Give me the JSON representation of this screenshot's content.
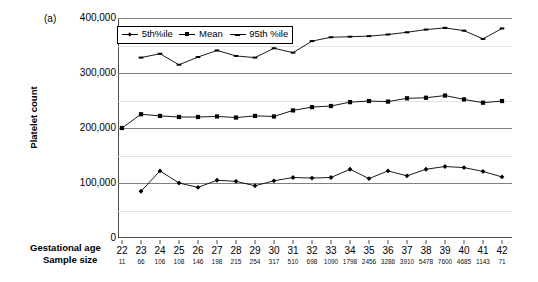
{
  "figure": {
    "panel_label": "(a)",
    "row_title_age": "Gestational age",
    "row_title_sample": "Sample size"
  },
  "chart_data": {
    "type": "line",
    "title": "",
    "xlabel": "Gestational age",
    "ylabel": "Platelet count",
    "ylim": [
      0,
      400000
    ],
    "yticks": [
      0,
      100000,
      200000,
      300000,
      400000
    ],
    "ytick_labels": [
      "0",
      "100,000",
      "200,000",
      "300,000",
      "400,000"
    ],
    "grid": true,
    "legend_position": "top-left-inside",
    "categories": [
      22,
      23,
      24,
      25,
      26,
      27,
      28,
      29,
      30,
      31,
      32,
      33,
      34,
      35,
      36,
      37,
      38,
      39,
      40,
      41,
      42
    ],
    "x_tick_labels": [
      "22",
      "23",
      "24",
      "25",
      "26",
      "27",
      "28",
      "29",
      "30",
      "31",
      "32",
      "33",
      "34",
      "35",
      "36",
      "37",
      "38",
      "39",
      "40",
      "41",
      "42"
    ],
    "sample_size_label": "Sample size",
    "sample_sizes": [
      11,
      66,
      106,
      108,
      146,
      198,
      215,
      254,
      317,
      510,
      698,
      1090,
      1798,
      2456,
      3286,
      3910,
      5478,
      7600,
      4685,
      1143,
      71
    ],
    "series": [
      {
        "name": "5th%ile",
        "marker": "diamond",
        "values": [
          null,
          85000,
          122000,
          100000,
          92000,
          105000,
          103000,
          95000,
          104000,
          110000,
          109000,
          110000,
          125000,
          108000,
          122000,
          113000,
          125000,
          130000,
          128000,
          121000,
          111000
        ]
      },
      {
        "name": "Mean",
        "marker": "square",
        "values": [
          200000,
          225000,
          222000,
          220000,
          220000,
          221000,
          219000,
          222000,
          221000,
          232000,
          238000,
          240000,
          247000,
          249000,
          248000,
          254000,
          255000,
          259000,
          252000,
          246000,
          249000
        ]
      },
      {
        "name": "95th %ile",
        "marker": "dash",
        "values": [
          null,
          328000,
          335000,
          315000,
          329000,
          341000,
          331000,
          328000,
          345000,
          337000,
          358000,
          365000,
          366000,
          367000,
          370000,
          374000,
          379000,
          382000,
          377000,
          362000,
          381000
        ]
      }
    ],
    "legend_entries": [
      "5th%ile",
      "Mean",
      "95th %ile"
    ]
  }
}
